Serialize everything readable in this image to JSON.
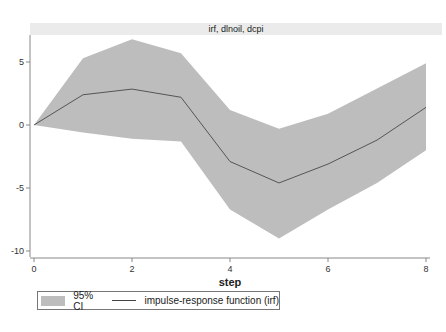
{
  "chart_data": {
    "type": "area",
    "title": "irf, dlnoil, dcpi",
    "xlabel": "step",
    "ylabel": "",
    "x": [
      0,
      1,
      2,
      3,
      4,
      5,
      6,
      7,
      8
    ],
    "series": [
      {
        "name": "impulse-response function (irf)",
        "kind": "line",
        "values": [
          0,
          2.4,
          2.85,
          2.2,
          -2.9,
          -4.6,
          -3.1,
          -1.2,
          1.4
        ]
      },
      {
        "name": "95% CI upper",
        "kind": "band-upper",
        "values": [
          0,
          5.3,
          6.8,
          5.7,
          1.2,
          -0.3,
          0.9,
          2.9,
          4.9
        ]
      },
      {
        "name": "95% CI lower",
        "kind": "band-lower",
        "values": [
          0,
          -0.6,
          -1.1,
          -1.3,
          -6.7,
          -9.0,
          -6.7,
          -4.6,
          -2.0
        ]
      }
    ],
    "xticks": [
      0,
      2,
      4,
      6,
      8
    ],
    "yticks": [
      -10,
      -5,
      0,
      5
    ],
    "xlim": [
      0,
      8
    ],
    "ylim": [
      -10.5,
      7.3
    ],
    "grid": false,
    "legend": {
      "position": "bottom",
      "entries": [
        "95% CI",
        "impulse-response function (irf)"
      ]
    },
    "colors": {
      "band": "#bdbdbd",
      "line": "#555555",
      "title_bg": "#eaeaea",
      "axis": "#888888"
    }
  },
  "legend": {
    "ci_label": "95% CI",
    "irf_label": "impulse-response function (irf)"
  }
}
